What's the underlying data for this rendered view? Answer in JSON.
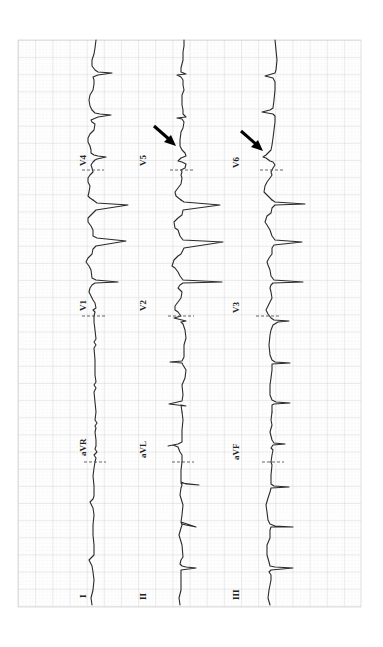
{
  "figure": {
    "type": "12-lead ECG (rotated 90° counter-clockwise)",
    "orientation": "time axis runs bottom-to-top",
    "paper": {
      "background": "#ffffff",
      "grid_minor_color": "#e6e6e6",
      "grid_major_color": "#c8c8c8",
      "area": {
        "x": 18,
        "y": 40,
        "width": 343,
        "height": 567
      }
    },
    "trace_color": "#2a2a2a"
  },
  "rows": [
    {
      "id": "row-1",
      "baseline_x": 92,
      "leads": [
        {
          "label": "I",
          "label_pos": {
            "x": 84,
            "y": 598
          }
        },
        {
          "label": "aVR",
          "label_pos": {
            "x": 84,
            "y": 452
          }
        },
        {
          "label": "V1",
          "label_pos": {
            "x": 84,
            "y": 306
          }
        },
        {
          "label": "V4",
          "label_pos": {
            "x": 84,
            "y": 160
          }
        }
      ]
    },
    {
      "id": "row-2",
      "baseline_x": 180,
      "leads": [
        {
          "label": "II",
          "label_pos": {
            "x": 146,
            "y": 598
          }
        },
        {
          "label": "aVL",
          "label_pos": {
            "x": 146,
            "y": 452
          }
        },
        {
          "label": "V2",
          "label_pos": {
            "x": 146,
            "y": 306
          }
        },
        {
          "label": "V5",
          "label_pos": {
            "x": 146,
            "y": 160
          }
        }
      ]
    },
    {
      "id": "row-3",
      "baseline_x": 268,
      "leads": [
        {
          "label": "III",
          "label_pos": {
            "x": 239,
            "y": 598
          }
        },
        {
          "label": "aVF",
          "label_pos": {
            "x": 239,
            "y": 452
          }
        },
        {
          "label": "V3",
          "label_pos": {
            "x": 239,
            "y": 306
          }
        },
        {
          "label": "V6",
          "label_pos": {
            "x": 239,
            "y": 160
          }
        }
      ]
    }
  ],
  "separators_y": [
    462,
    316,
    170
  ],
  "annotations": [
    {
      "type": "arrow",
      "target_lead": "V5",
      "from": {
        "x": 153,
        "y": 125
      },
      "to": {
        "x": 175,
        "y": 145
      }
    },
    {
      "type": "arrow",
      "target_lead": "V6",
      "from": {
        "x": 240,
        "y": 130
      },
      "to": {
        "x": 262,
        "y": 150
      }
    }
  ]
}
